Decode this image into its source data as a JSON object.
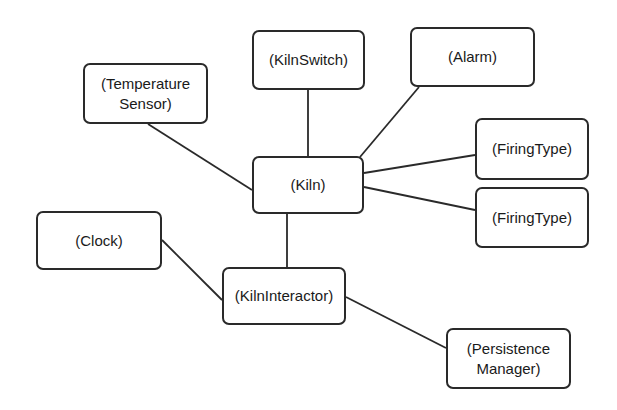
{
  "diagram": {
    "type": "object-collaboration",
    "line_color": "#2a2a2a",
    "nodes": [
      {
        "id": "kiln",
        "label": "(Kiln)",
        "x": 252,
        "y": 156,
        "w": 112,
        "h": 58
      },
      {
        "id": "kilnswitch",
        "label": "(KilnSwitch)",
        "x": 252,
        "y": 30,
        "w": 113,
        "h": 60
      },
      {
        "id": "alarm",
        "label": "(Alarm)",
        "x": 410,
        "y": 27,
        "w": 125,
        "h": 60
      },
      {
        "id": "temperature-sensor",
        "label": "(Temperature\nSensor)",
        "x": 83,
        "y": 63,
        "w": 125,
        "h": 61
      },
      {
        "id": "firingtype-1",
        "label": "(FiringType)",
        "x": 475,
        "y": 118,
        "w": 114,
        "h": 62
      },
      {
        "id": "firingtype-2",
        "label": "(FiringType)",
        "x": 475,
        "y": 187,
        "w": 114,
        "h": 61
      },
      {
        "id": "clock",
        "label": "(Clock)",
        "x": 36,
        "y": 211,
        "w": 126,
        "h": 59
      },
      {
        "id": "kilninteractor",
        "label": "(KilnInteractor)",
        "x": 222,
        "y": 267,
        "w": 124,
        "h": 58
      },
      {
        "id": "persistence-manager",
        "label": "(Persistence\nManager)",
        "x": 446,
        "y": 328,
        "w": 125,
        "h": 61
      }
    ],
    "edges": [
      {
        "from": "kiln",
        "to": "kilnswitch",
        "x1": 308,
        "y1": 156,
        "x2": 308,
        "y2": 90
      },
      {
        "from": "kiln",
        "to": "alarm",
        "x1": 360,
        "y1": 157,
        "x2": 419,
        "y2": 87
      },
      {
        "from": "kiln",
        "to": "temperature-sensor",
        "x1": 252,
        "y1": 190,
        "x2": 148,
        "y2": 124
      },
      {
        "from": "kiln",
        "to": "firingtype-1",
        "x1": 364,
        "y1": 173,
        "x2": 475,
        "y2": 155
      },
      {
        "from": "kiln",
        "to": "firingtype-2",
        "x1": 364,
        "y1": 187,
        "x2": 475,
        "y2": 210
      },
      {
        "from": "kiln",
        "to": "kilninteractor",
        "x1": 287,
        "y1": 214,
        "x2": 287,
        "y2": 267
      },
      {
        "from": "clock",
        "to": "kilninteractor",
        "x1": 162,
        "y1": 240,
        "x2": 222,
        "y2": 300
      },
      {
        "from": "kilninteractor",
        "to": "persistence-manager",
        "x1": 346,
        "y1": 297,
        "x2": 446,
        "y2": 348
      }
    ]
  }
}
